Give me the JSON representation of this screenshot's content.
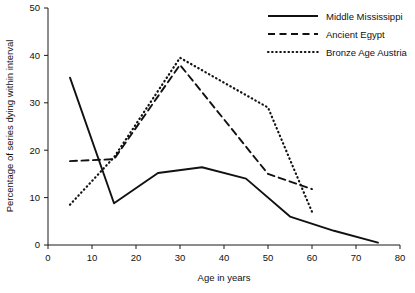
{
  "chart_data": {
    "type": "line",
    "title": "",
    "xlabel": "Age in years",
    "ylabel": "Percentage of series dying within interval",
    "xlim": [
      0,
      80
    ],
    "ylim": [
      0,
      50
    ],
    "xticks": [
      0,
      10,
      20,
      30,
      40,
      50,
      60,
      70,
      80
    ],
    "yticks": [
      0,
      10,
      20,
      30,
      40,
      50
    ],
    "xtick_labels": [
      "0",
      "10",
      "20",
      "30",
      "40",
      "50",
      "60",
      "70",
      "80"
    ],
    "ytick_labels": [
      "0",
      "10",
      "20",
      "30",
      "40",
      "50"
    ],
    "grid": false,
    "legend_position": "top-right",
    "series": [
      {
        "name": "Middle Mississippi",
        "style": "solid",
        "color": "#111111",
        "x": [
          5,
          15,
          25,
          35,
          45,
          55,
          65,
          75
        ],
        "values": [
          35.3,
          8.8,
          15.2,
          16.4,
          14.0,
          6.0,
          3.0,
          0.5
        ]
      },
      {
        "name": "Ancient Egypt",
        "style": "dashed",
        "color": "#111111",
        "x": [
          5,
          15,
          30,
          50,
          60
        ],
        "values": [
          17.7,
          18.1,
          38.0,
          15.0,
          11.8
        ]
      },
      {
        "name": "Bronze Age Austria",
        "style": "dotted",
        "color": "#111111",
        "x": [
          5,
          15,
          30,
          50,
          60
        ],
        "values": [
          8.5,
          18.5,
          39.5,
          29.0,
          7.0
        ]
      }
    ]
  }
}
